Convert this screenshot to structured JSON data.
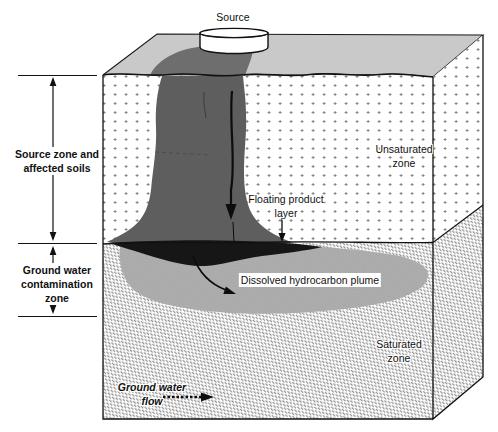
{
  "diagram": {
    "type": "groundwater-contamination-cross-section",
    "labels": {
      "source": "Source",
      "source_zone": [
        "Source zone and",
        "affected soils"
      ],
      "gw_zone": [
        "Ground water",
        "contamination",
        "zone"
      ],
      "unsaturated": [
        "Unsaturated",
        "zone"
      ],
      "floating": [
        "Floating product",
        "layer"
      ],
      "dissolved": "Dissolved hydrocarbon plume",
      "saturated": [
        "Saturated",
        "zone"
      ],
      "flow": [
        "Ground water",
        "flow"
      ]
    },
    "colors": {
      "top_face": "#c9c9c9",
      "top_stain": "#6e6e6e",
      "source_plume": "#5e5e5e",
      "floating_product": "#161616",
      "dissolved_plume": "#adadad",
      "outline": "#1a1a1a",
      "unsaturated_dot": "#878787",
      "saturated_hatch": "#949494"
    }
  }
}
